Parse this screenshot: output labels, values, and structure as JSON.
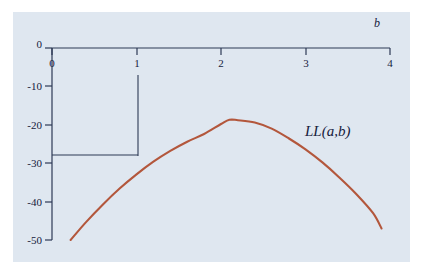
{
  "figure": {
    "background_color": "#ffffff",
    "panel_color": "#dfe7f0",
    "axis_color": "#2d3a55",
    "curve_color": "#b3573c",
    "guide_color": "#2d3a55"
  },
  "chart_data": {
    "type": "line",
    "title": "",
    "subtitle": "",
    "xlabel": "b",
    "ylabel": "",
    "xlim": [
      0,
      4
    ],
    "ylim": [
      -50,
      0
    ],
    "grid": false,
    "legend_position": "inline-right",
    "xticks": [
      "0",
      "1",
      "2",
      "3",
      "4"
    ],
    "xtick_values": [
      0,
      1,
      2,
      3,
      4
    ],
    "yticks": [
      "0",
      "-10",
      "-20",
      "-30",
      "-40",
      "-50"
    ],
    "ytick_values": [
      0,
      -10,
      -20,
      -30,
      -40,
      -50
    ],
    "series": [
      {
        "name": "LL(a,b)",
        "label": "LL(a,b)",
        "color": "#b3573c",
        "x": [
          0.22,
          0.4,
          0.6,
          0.8,
          1.0,
          1.2,
          1.4,
          1.6,
          1.8,
          2.0,
          2.1,
          2.2,
          2.4,
          2.6,
          2.8,
          3.0,
          3.2,
          3.4,
          3.6,
          3.8,
          3.9
        ],
        "y": [
          -50.0,
          -45.4,
          -40.8,
          -36.6,
          -32.9,
          -29.6,
          -26.8,
          -24.4,
          -22.4,
          -19.8,
          -18.7,
          -18.8,
          -19.4,
          -21.0,
          -23.5,
          -26.4,
          -29.8,
          -33.7,
          -38.0,
          -43.0,
          -47.0
        ]
      }
    ],
    "annotations": [
      {
        "name": "guide-vertical-b1",
        "type": "vertical-segment",
        "x": 1.0,
        "y_from": -7.0,
        "y_to": -28.0
      },
      {
        "name": "guide-horizontal-ll1",
        "type": "horizontal-segment",
        "y": -28.0,
        "x_from": 0.0,
        "x_to": 1.0
      }
    ],
    "series_label_text": "LL(a,b)",
    "x_axis_title": "b"
  }
}
